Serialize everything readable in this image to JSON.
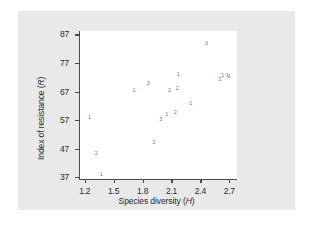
{
  "figure": {
    "background": "#e9e9e9",
    "plot_background": "#ffffff",
    "axis_color": "#4a4a4a",
    "marker_color": "#777777"
  },
  "chart_data": {
    "type": "scatter",
    "title": "",
    "xlabel": "Species diversity (H)",
    "ylabel": "Index of resistance (R)",
    "xlabel_prefix": "Species diversity (",
    "xlabel_italic": "H",
    "xlabel_suffix": ")",
    "ylabel_prefix": "Index of resistance (",
    "ylabel_italic": "R",
    "ylabel_suffix": ")",
    "xlim": [
      1.14,
      2.78
    ],
    "ylim": [
      36.0,
      88.2
    ],
    "xticks": [
      1.2,
      1.5,
      1.8,
      2.1,
      2.4,
      2.7
    ],
    "xticklabels": [
      "1.2",
      "1.5",
      "1.8",
      "2.1",
      "2.4",
      "2.7"
    ],
    "yticks": [
      37,
      47,
      57,
      67,
      77,
      87
    ],
    "yticklabels": [
      "37",
      "47",
      "57",
      "67",
      "77",
      "87"
    ],
    "grid": false,
    "legend": false,
    "marker_style": "small-digit-glyph",
    "points": [
      {
        "x": 1.25,
        "y": 57.6,
        "label": "1"
      },
      {
        "x": 1.32,
        "y": 45.0,
        "label": "2"
      },
      {
        "x": 1.37,
        "y": 37.8,
        "label": "1"
      },
      {
        "x": 1.71,
        "y": 67.3,
        "label": "1"
      },
      {
        "x": 1.86,
        "y": 69.6,
        "label": "3"
      },
      {
        "x": 1.92,
        "y": 49.1,
        "label": "2"
      },
      {
        "x": 1.99,
        "y": 57.1,
        "label": "3"
      },
      {
        "x": 2.05,
        "y": 58.8,
        "label": "1"
      },
      {
        "x": 2.08,
        "y": 67.1,
        "label": "2"
      },
      {
        "x": 2.14,
        "y": 59.3,
        "label": "2"
      },
      {
        "x": 2.16,
        "y": 68.0,
        "label": "2"
      },
      {
        "x": 2.17,
        "y": 72.8,
        "label": "1"
      },
      {
        "x": 2.3,
        "y": 62.5,
        "label": "1"
      },
      {
        "x": 2.46,
        "y": 83.5,
        "label": "3"
      },
      {
        "x": 2.6,
        "y": 70.9,
        "label": "2"
      },
      {
        "x": 2.63,
        "y": 72.6,
        "label": "1"
      },
      {
        "x": 2.68,
        "y": 72.5,
        "label": "1"
      },
      {
        "x": 2.7,
        "y": 72.2,
        "label": "1"
      }
    ]
  }
}
